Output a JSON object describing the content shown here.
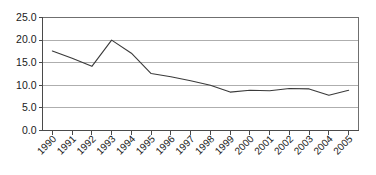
{
  "chart_data": {
    "type": "line",
    "title": "",
    "subtitle": "",
    "xlabel": "",
    "ylabel": "",
    "categories": [
      "1990",
      "1991",
      "1992",
      "1993",
      "1994",
      "1995",
      "1996",
      "1997",
      "1998",
      "1999",
      "2000",
      "2001",
      "2002",
      "2003",
      "2004",
      "2005"
    ],
    "values": [
      17.6,
      16.0,
      14.2,
      20.0,
      17.1,
      12.6,
      11.9,
      11.0,
      10.0,
      8.5,
      8.9,
      8.8,
      9.3,
      9.2,
      7.8,
      8.9
    ],
    "series": [
      {
        "name": "",
        "values": [
          17.6,
          16.0,
          14.2,
          20.0,
          17.1,
          12.6,
          11.9,
          11.0,
          10.0,
          8.5,
          8.9,
          8.8,
          9.3,
          9.2,
          7.8,
          8.9
        ]
      }
    ],
    "ylim": [
      0.0,
      25.0
    ],
    "ytick_labels": [
      "25.0",
      "20.0",
      "15.0",
      "10.0",
      "5.0",
      "0.0"
    ],
    "ytick_values": [
      25.0,
      20.0,
      15.0,
      10.0,
      5.0,
      0.0
    ],
    "grid": true,
    "grid_axis": "y",
    "legend": false,
    "legend_position": "none",
    "xtick_label_rotation": "45",
    "line_color": "#3a3a3a",
    "gridline_color": "#9a9a9a",
    "axis_color": "#4a4a4a",
    "background_color": "#ffffff"
  }
}
